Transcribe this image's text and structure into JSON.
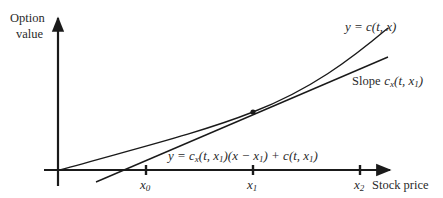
{
  "diagram": {
    "y_axis_label_line1": "Option",
    "y_axis_label_line2": "value",
    "x_axis_label": "Stock price",
    "curve_label": "y = c(t, x)",
    "tangent_slope_label": "Slope c_x(t, x_1)",
    "tangent_slope_prefix": "Slope",
    "tangent_equation_label": "y = c_x(t, x_1)(x − x_1) + c(t, x_1)",
    "ticks": [
      {
        "label": "x_0",
        "base": "x",
        "sub": "0"
      },
      {
        "label": "x_1",
        "base": "x",
        "sub": "1"
      },
      {
        "label": "x_2",
        "base": "x",
        "sub": "2"
      }
    ],
    "line_color": "#1a1a1a",
    "background": "#ffffff"
  }
}
